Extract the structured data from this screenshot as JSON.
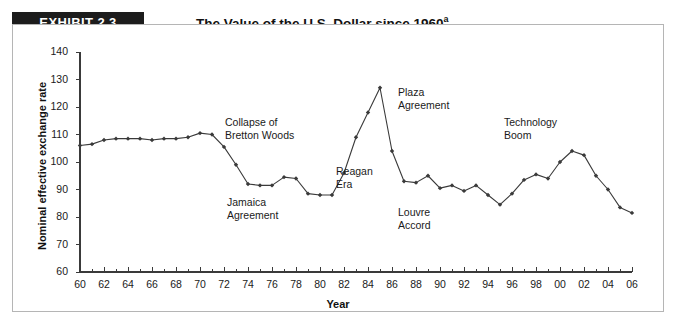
{
  "exhibit": {
    "badge_label": "EXHIBIT 2.3",
    "title": "The Value of the U.S. Dollar since 1960",
    "title_superscript": "a"
  },
  "chart_data": {
    "type": "line",
    "title": "The Value of the U.S. Dollar since 1960",
    "xlabel": "Year",
    "ylabel": "Nominal effective exchange rate",
    "xlim": [
      60,
      106
    ],
    "ylim": [
      60,
      140
    ],
    "ytick_labels": [
      "60",
      "70",
      "80",
      "90",
      "100",
      "110",
      "120",
      "130",
      "140"
    ],
    "ytick_values": [
      60,
      70,
      80,
      90,
      100,
      110,
      120,
      130,
      140
    ],
    "xtick_labels": [
      "60",
      "62",
      "64",
      "66",
      "68",
      "70",
      "72",
      "74",
      "76",
      "78",
      "80",
      "82",
      "84",
      "86",
      "88",
      "90",
      "92",
      "94",
      "96",
      "98",
      "00",
      "02",
      "04",
      "06"
    ],
    "xtick_values": [
      60,
      62,
      64,
      66,
      68,
      70,
      72,
      74,
      76,
      78,
      80,
      82,
      84,
      86,
      88,
      90,
      92,
      94,
      96,
      98,
      100,
      102,
      104,
      106
    ],
    "minor_xticks": [
      61,
      63,
      65,
      67,
      69,
      71,
      73,
      75,
      77,
      79,
      81,
      83,
      85,
      87,
      89,
      91,
      93,
      95,
      97,
      99,
      101,
      103,
      105
    ],
    "grid": false,
    "legend": "none",
    "marker": "diamond",
    "line_color": "#3a3a3a",
    "x": [
      60,
      61,
      62,
      63,
      64,
      65,
      66,
      67,
      68,
      69,
      70,
      71,
      72,
      73,
      74,
      75,
      76,
      77,
      78,
      79,
      80,
      81,
      82,
      83,
      84,
      85,
      86,
      87,
      88,
      89,
      90,
      91,
      92,
      93,
      94,
      95,
      96,
      97,
      98,
      99,
      100,
      101,
      102,
      103,
      104,
      105,
      106
    ],
    "x_year_labels": [
      "1960",
      "1961",
      "1962",
      "1963",
      "1964",
      "1965",
      "1966",
      "1967",
      "1968",
      "1969",
      "1970",
      "1971",
      "1972",
      "1973",
      "1974",
      "1975",
      "1976",
      "1977",
      "1978",
      "1979",
      "1980",
      "1981",
      "1982",
      "1983",
      "1984",
      "1985",
      "1986",
      "1987",
      "1988",
      "1989",
      "1990",
      "1991",
      "1992",
      "1993",
      "1994",
      "1995",
      "1996",
      "1997",
      "1998",
      "1999",
      "2000",
      "2001",
      "2002",
      "2003",
      "2004",
      "2005",
      "2006"
    ],
    "values": [
      106,
      106.5,
      108,
      108.5,
      108.5,
      108.5,
      108,
      108.5,
      108.5,
      109,
      110.5,
      110,
      105.5,
      99,
      92,
      91.5,
      91.5,
      94.5,
      94,
      88.5,
      88,
      88,
      96,
      109,
      118,
      127,
      104,
      93,
      92.5,
      95,
      90.5,
      91.5,
      89.5,
      91.5,
      88,
      84.5,
      88.5,
      93.5,
      95.5,
      94,
      100,
      104,
      102.5,
      95,
      90,
      83.5,
      81.5
    ]
  },
  "annotations": [
    {
      "id": "bretton-woods",
      "text": "Collapse of\nBretton Woods"
    },
    {
      "id": "jamaica-agreement",
      "text": "Jamaica\nAgreement"
    },
    {
      "id": "reagan-era",
      "text": "Reagan\nEra"
    },
    {
      "id": "plaza-agreement",
      "text": "Plaza\nAgreement"
    },
    {
      "id": "louvre-accord",
      "text": "Louvre\nAccord"
    },
    {
      "id": "technology-boom",
      "text": "Technology\nBoom"
    }
  ],
  "colors": {
    "badge_background": "#1c1c1c",
    "badge_text": "#ffffff",
    "frame_border": "#b5b5b5",
    "axis": "#3a3a3a",
    "series": "#3a3a3a",
    "text": "#1a1a1a"
  }
}
